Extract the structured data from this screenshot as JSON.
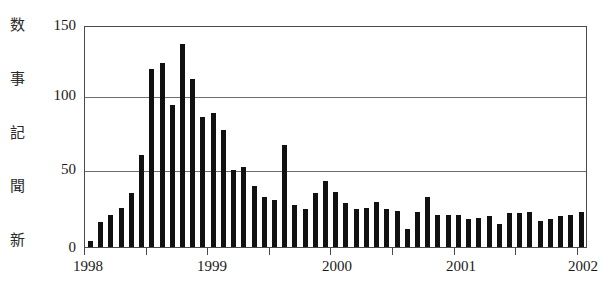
{
  "chart_data": {
    "type": "bar",
    "title": "",
    "xlabel": "",
    "ylabel": "新聞記事数",
    "ylabel_chars": [
      "数",
      "事",
      "記",
      "聞",
      "新"
    ],
    "ylim": [
      0,
      150
    ],
    "yticks": [
      150,
      100,
      50,
      0
    ],
    "grid": true,
    "legend": "none",
    "bar_color": "#111111",
    "frame_color": "#4a4a4a",
    "x_tick_labels": [
      "1998",
      "1999",
      "2000",
      "2001",
      "2002"
    ],
    "x_minor_tick_interval_months": 6,
    "x_unit": "month",
    "categories": [
      "1998-01",
      "1998-02",
      "1998-03",
      "1998-04",
      "1998-05",
      "1998-06",
      "1998-07",
      "1998-08",
      "1998-09",
      "1998-10",
      "1998-11",
      "1998-12",
      "1999-01",
      "1999-02",
      "1999-03",
      "1999-04",
      "1999-05",
      "1999-06",
      "1999-07",
      "1999-08",
      "1999-09",
      "1999-10",
      "1999-11",
      "1999-12",
      "2000-01",
      "2000-02",
      "2000-03",
      "2000-04",
      "2000-05",
      "2000-06",
      "2000-07",
      "2000-08",
      "2000-09",
      "2000-10",
      "2000-11",
      "2000-12",
      "2001-01",
      "2001-02",
      "2001-03",
      "2001-04",
      "2001-05",
      "2001-06",
      "2001-07",
      "2001-08",
      "2001-09",
      "2001-10",
      "2001-11",
      "2001-12",
      "2002-01"
    ],
    "values": [
      4,
      17,
      22,
      27,
      37,
      63,
      122,
      126,
      97,
      139,
      115,
      89,
      92,
      80,
      53,
      55,
      42,
      34,
      32,
      70,
      29,
      26,
      37,
      45,
      38,
      30,
      26,
      27,
      31,
      26,
      25,
      12,
      24,
      34,
      22,
      22,
      22,
      19,
      20,
      21,
      16,
      23,
      23,
      24,
      18,
      19,
      21,
      22,
      24
    ]
  }
}
